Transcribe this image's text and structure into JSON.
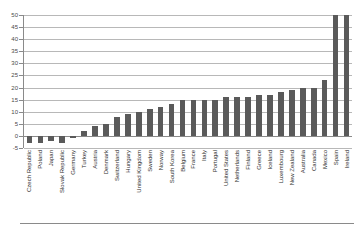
{
  "chart_data": {
    "type": "bar",
    "title": "",
    "xlabel": "",
    "ylabel": "",
    "ylim": [
      -5,
      50
    ],
    "ytick_step": 5,
    "yticks": [
      50,
      45,
      40,
      35,
      30,
      25,
      20,
      15,
      10,
      5,
      0,
      -5
    ],
    "grid": true,
    "legend": "none",
    "bar_color": "#5a5a5a",
    "gridline_color": "#b8b8b8",
    "axis_color": "#8a8a8a",
    "categories": [
      "Czech Republic",
      "Poland",
      "Japan",
      "Slovak Republic",
      "Germany",
      "Turkey",
      "Austria",
      "Denmark",
      "Switzerland",
      "Hungary",
      "United Kingdom",
      "Sweden",
      "Norway",
      "South Korea",
      "Belgium",
      "France",
      "Italy",
      "Portugal",
      "United States",
      "Netherlands",
      "Finland",
      "Greece",
      "Iceland",
      "Luxembourg",
      "New Zealand",
      "Australia",
      "Canada",
      "Mexico",
      "Spain",
      "Ireland"
    ],
    "values": [
      -3,
      -3,
      -2,
      -3,
      -1,
      2,
      4,
      5,
      8,
      9,
      10,
      11,
      12,
      13,
      15,
      15,
      15,
      15,
      16,
      16,
      16,
      17,
      17,
      18,
      19,
      20,
      20,
      23,
      50,
      50
    ]
  }
}
